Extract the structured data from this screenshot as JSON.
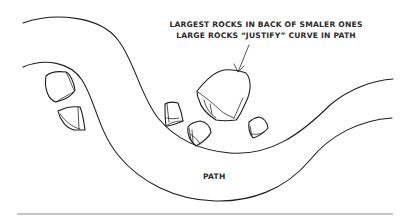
{
  "diagram": {
    "annotation": {
      "line1": "LARGEST ROCKS IN BACK OF SMALER ONES",
      "line2": "LARGE ROCKS “JUSTIFY” CURVE IN PATH"
    },
    "path_label": "PATH",
    "colors": {
      "ink": "#1e1e1e",
      "rule": "#8a8a8a",
      "background": "#ffffff"
    },
    "elements": [
      "path-upper-edge",
      "path-lower-edge",
      "large-rock",
      "small-rock-left-1",
      "small-rock-left-2",
      "small-rock-center-1",
      "small-rock-center-2",
      "small-rock-right",
      "annotation-arrow",
      "bottom-rule"
    ]
  }
}
